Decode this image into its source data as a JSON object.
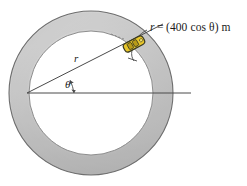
{
  "figure": {
    "equation_label": {
      "variable": "r",
      "equals": " = ",
      "expression": "(400 cos θ) m",
      "full_text": "r = (400 cos θ) m"
    },
    "radius_label": "r",
    "angle_label": "θ",
    "colors": {
      "ring_fill_light": "#d2d2d2",
      "ring_fill_mid": "#b9b9b9",
      "ring_fill_dark": "#9a9a9a",
      "ring_stroke": "#6e6e6e",
      "inner_stroke": "#8a8a8a",
      "line_stroke": "#4a4a4a",
      "text": "#1a1a1a",
      "vehicle_body": "#e8c62a",
      "vehicle_outline": "#3a3a22",
      "background": "#ffffff"
    },
    "geometry": {
      "center_x": 91,
      "center_y": 93,
      "outer_radius": 82,
      "inner_radius": 62,
      "ray_angle_deg": 27,
      "horizontal_line_end_x": 191
    },
    "vehicle": {
      "name": "car-on-track",
      "x": 134,
      "y": 44,
      "rotation_deg": -28
    }
  }
}
